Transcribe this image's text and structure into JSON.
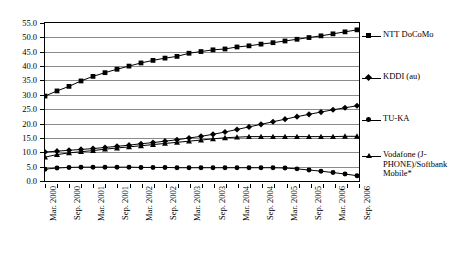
{
  "chart_data": {
    "type": "line",
    "title": "",
    "xlabel": "",
    "ylabel": "",
    "ylim": [
      0.0,
      55.0
    ],
    "y_ticks": [
      "0.0",
      "5.0",
      "10.0",
      "15.0",
      "20.0",
      "25.0",
      "30.0",
      "35.0",
      "40.0",
      "45.0",
      "50.0",
      "55.0"
    ],
    "y_tick_values": [
      0.0,
      5.0,
      10.0,
      15.0,
      20.0,
      25.0,
      30.0,
      35.0,
      40.0,
      45.0,
      50.0,
      55.0
    ],
    "grid": true,
    "legend_position": "right",
    "x_tick_labels": [
      "Mar. 2000",
      "Sep. 2000",
      "Mar. 2001",
      "Sep. 2001",
      "Mar. 2002",
      "Sep. 2002",
      "Mar. 2003",
      "Sep. 2003",
      "Mar. 2004",
      "Sep. 2004",
      "Mar. 2005",
      "Sep. 2005",
      "Mar. 2006",
      "Sep. 2006"
    ],
    "x_tick_indices": [
      0,
      2,
      4,
      6,
      8,
      10,
      12,
      14,
      16,
      18,
      20,
      22,
      24,
      26
    ],
    "x_points": 27,
    "series": [
      {
        "name": "NTT DoCoMo",
        "marker": "square",
        "values": [
          29.4,
          31.2,
          32.8,
          34.7,
          36.3,
          37.6,
          38.8,
          39.9,
          41.0,
          41.9,
          42.7,
          43.3,
          44.4,
          45.0,
          45.6,
          45.9,
          46.6,
          47.0,
          47.6,
          48.1,
          48.7,
          49.3,
          49.9,
          50.5,
          51.2,
          51.9,
          52.6
        ]
      },
      {
        "name": "KDDI (au)",
        "marker": "diamond",
        "values": [
          9.8,
          10.1,
          10.4,
          10.7,
          11.0,
          11.4,
          11.8,
          12.2,
          12.7,
          13.1,
          13.6,
          14.1,
          14.7,
          15.3,
          16.0,
          16.8,
          17.7,
          18.6,
          19.5,
          20.4,
          21.3,
          22.2,
          23.0,
          23.8,
          24.6,
          25.3,
          26.0
        ]
      },
      {
        "name": "TU-KA",
        "marker": "circle",
        "values": [
          3.8,
          4.2,
          4.4,
          4.5,
          4.5,
          4.5,
          4.5,
          4.5,
          4.4,
          4.4,
          4.4,
          4.3,
          4.3,
          4.3,
          4.3,
          4.3,
          4.3,
          4.3,
          4.3,
          4.3,
          4.2,
          3.9,
          3.5,
          3.1,
          2.6,
          2.1,
          1.5
        ]
      },
      {
        "name": "Vodafone (J-PHONE)/Softbank Mobile*",
        "marker": "triangle",
        "values": [
          8.0,
          8.9,
          9.5,
          9.9,
          10.3,
          10.8,
          11.2,
          11.6,
          12.0,
          12.4,
          12.8,
          13.2,
          13.6,
          14.0,
          14.4,
          14.8,
          15.0,
          15.2,
          15.2,
          15.2,
          15.2,
          15.2,
          15.2,
          15.2,
          15.2,
          15.3,
          15.3
        ]
      }
    ]
  },
  "legend": {
    "entries": [
      {
        "label": "NTT DoCoMo",
        "marker": "square"
      },
      {
        "label": "KDDI (au)",
        "marker": "diamond"
      },
      {
        "label": "TU-KA",
        "marker": "circle"
      },
      {
        "label": "Vodafone (J-\nPHONE)/Softbank\nMobile*",
        "marker": "triangle"
      }
    ]
  },
  "colors": {
    "line": "#000000",
    "grid": "#8a8a8a",
    "frame": "#000000",
    "background": "#ffffff"
  }
}
